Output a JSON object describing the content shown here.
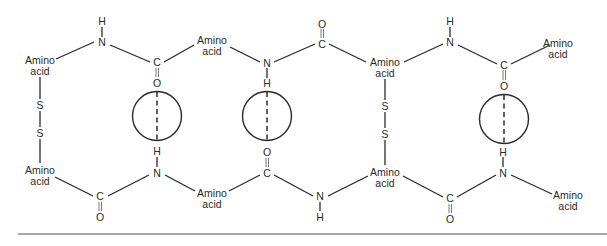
{
  "figure": {
    "labels": {
      "amino_acid_line1": "Amino",
      "amino_acid_line2": "acid",
      "nitrogen": "N",
      "hydrogen": "H",
      "carbon": "C",
      "oxygen": "O",
      "sulfur": "S"
    },
    "top_chain": [
      {
        "type": "amino_acid",
        "label": [
          "Amino",
          "acid"
        ]
      },
      {
        "type": "NH",
        "atoms": [
          "N",
          "H"
        ],
        "substituent_side": "up"
      },
      {
        "type": "CO",
        "atoms": [
          "C",
          "O"
        ],
        "substituent_side": "down"
      },
      {
        "type": "amino_acid",
        "label": [
          "Amino",
          "acid"
        ]
      },
      {
        "type": "NH",
        "atoms": [
          "N",
          "H"
        ],
        "substituent_side": "down"
      },
      {
        "type": "CO",
        "atoms": [
          "C",
          "O"
        ],
        "substituent_side": "up"
      },
      {
        "type": "amino_acid",
        "label": [
          "Amino",
          "acid"
        ]
      },
      {
        "type": "NH",
        "atoms": [
          "N",
          "H"
        ],
        "substituent_side": "up"
      },
      {
        "type": "CO",
        "atoms": [
          "C",
          "O"
        ],
        "substituent_side": "down"
      },
      {
        "type": "amino_acid",
        "label": [
          "Amino",
          "acid"
        ]
      }
    ],
    "bottom_chain": [
      {
        "type": "amino_acid",
        "label": [
          "Amino",
          "acid"
        ]
      },
      {
        "type": "CO",
        "atoms": [
          "C",
          "O"
        ],
        "substituent_side": "down"
      },
      {
        "type": "NH",
        "atoms": [
          "N",
          "H"
        ],
        "substituent_side": "up"
      },
      {
        "type": "amino_acid",
        "label": [
          "Amino",
          "acid"
        ]
      },
      {
        "type": "CO",
        "atoms": [
          "C",
          "O"
        ],
        "substituent_side": "up"
      },
      {
        "type": "NH",
        "atoms": [
          "N",
          "H"
        ],
        "substituent_side": "down"
      },
      {
        "type": "amino_acid",
        "label": [
          "Amino",
          "acid"
        ]
      },
      {
        "type": "CO",
        "atoms": [
          "C",
          "O"
        ],
        "substituent_side": "down"
      },
      {
        "type": "NH",
        "atoms": [
          "N",
          "H"
        ],
        "substituent_side": "up"
      },
      {
        "type": "amino_acid",
        "label": [
          "Amino",
          "acid"
        ]
      }
    ],
    "disulfide_bridges": [
      {
        "position": "left",
        "atoms": [
          "S",
          "S"
        ]
      },
      {
        "position": "center-right",
        "atoms": [
          "S",
          "S"
        ]
      }
    ],
    "hydrogen_bonds": [
      {
        "pair": [
          "C=O (top)",
          "H-N (bottom)"
        ],
        "circled": true
      },
      {
        "pair": [
          "N-H (top)",
          "O=C (bottom)"
        ],
        "circled": true
      },
      {
        "pair": [
          "C=O (top)",
          "H-N (bottom)"
        ],
        "circled": true
      }
    ]
  }
}
